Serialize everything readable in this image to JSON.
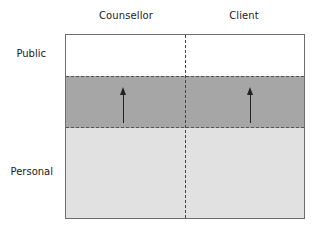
{
  "diagram": {
    "columns": [
      {
        "label": "Counsellor",
        "center_x": 126
      },
      {
        "label": "Client",
        "center_x": 244
      }
    ],
    "rows": [
      {
        "label": "Public",
        "fill": "#ffffff"
      },
      {
        "label": "",
        "fill": "#a6a6a6"
      },
      {
        "label": "Personal",
        "fill": "#e1e1e1"
      }
    ],
    "arrows": [
      {
        "column": "Counsellor",
        "direction": "up"
      },
      {
        "column": "Client",
        "direction": "up"
      }
    ],
    "colors": {
      "public_band": "#ffffff",
      "middle_band": "#a6a6a6",
      "personal_band": "#e1e1e1",
      "frame_border": "#6e6e6e",
      "dashed_lines": "#555555",
      "arrow": "#222222"
    }
  }
}
